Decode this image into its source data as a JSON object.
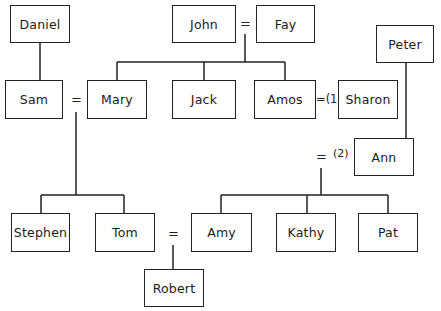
{
  "diagram": {
    "type": "family-tree",
    "people": {
      "daniel": "Daniel",
      "john": "John",
      "fay": "Fay",
      "peter": "Peter",
      "sam": "Sam",
      "mary": "Mary",
      "jack": "Jack",
      "amos": "Amos",
      "sharon": "Sharon",
      "ann": "Ann",
      "stephen": "Stephen",
      "tom": "Tom",
      "amy": "Amy",
      "kathy": "Kathy",
      "pat": "Pat",
      "robert": "Robert"
    },
    "marriage_symbols": {
      "john_fay": "=",
      "sam_mary": "=",
      "amos_sharon": "=(1)",
      "amos_ann": "=",
      "amos_ann_note": "(2)",
      "tom_amy": "="
    },
    "relations": [
      {
        "type": "parent-child",
        "parent": "Daniel",
        "child": "Sam"
      },
      {
        "type": "marriage",
        "a": "John",
        "b": "Fay"
      },
      {
        "type": "parent-child",
        "parents": [
          "John",
          "Fay"
        ],
        "children": [
          "Mary",
          "Jack",
          "Amos"
        ]
      },
      {
        "type": "marriage",
        "a": "Sam",
        "b": "Mary"
      },
      {
        "type": "parent-child",
        "parents": [
          "Sam",
          "Mary"
        ],
        "children": [
          "Stephen",
          "Tom"
        ]
      },
      {
        "type": "marriage",
        "a": "Amos",
        "b": "Sharon",
        "order": "(1)"
      },
      {
        "type": "parent-child",
        "parent": "Peter",
        "child": "Ann"
      },
      {
        "type": "marriage",
        "a": "Amos",
        "b": "Ann",
        "order": "(2)"
      },
      {
        "type": "parent-child",
        "parents": [
          "Amos",
          "Ann"
        ],
        "children": [
          "Amy",
          "Kathy",
          "Pat"
        ]
      },
      {
        "type": "marriage",
        "a": "Tom",
        "b": "Amy"
      },
      {
        "type": "parent-child",
        "parents": [
          "Tom",
          "Amy"
        ],
        "children": [
          "Robert"
        ]
      }
    ]
  }
}
